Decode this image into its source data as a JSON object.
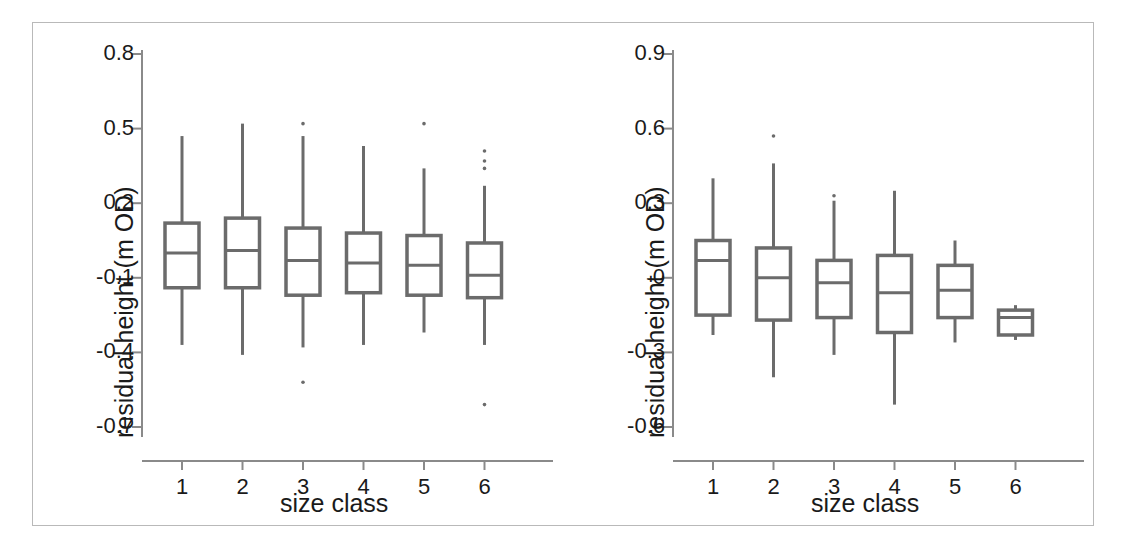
{
  "figure": {
    "background": "#ffffff",
    "frame_color": "#b9b9b9",
    "ink_color": "#6b6b6b",
    "text_color": "#1a1a1a"
  },
  "chart_data": [
    {
      "type": "box",
      "panel": "left",
      "title": "",
      "xlabel": "size class",
      "ylabel": "residual height (m OD)",
      "categories": [
        "1",
        "2",
        "3",
        "4",
        "5",
        "6"
      ],
      "xtick_labels": [
        "1",
        "2",
        "3",
        "4",
        "5",
        "6"
      ],
      "ytick_labels": [
        "0.8",
        "0.5",
        "0.2",
        "-0.1",
        "-0.4",
        "-0.7"
      ],
      "yticks": [
        0.8,
        0.5,
        0.2,
        -0.1,
        -0.4,
        -0.7
      ],
      "ylim": [
        -0.78,
        0.88
      ],
      "grid": false,
      "legend": "none",
      "boxes": [
        {
          "category": "1",
          "whisker_low": -0.37,
          "q1": -0.14,
          "median": 0.0,
          "q3": 0.12,
          "whisker_high": 0.47,
          "outliers": []
        },
        {
          "category": "2",
          "whisker_low": -0.41,
          "q1": -0.14,
          "median": 0.01,
          "q3": 0.14,
          "whisker_high": 0.52,
          "outliers": []
        },
        {
          "category": "3",
          "whisker_low": -0.38,
          "q1": -0.17,
          "median": -0.03,
          "q3": 0.1,
          "whisker_high": 0.47,
          "outliers": [
            0.52,
            -0.52
          ]
        },
        {
          "category": "4",
          "whisker_low": -0.37,
          "q1": -0.16,
          "median": -0.04,
          "q3": 0.08,
          "whisker_high": 0.43,
          "outliers": []
        },
        {
          "category": "5",
          "whisker_low": -0.32,
          "q1": -0.17,
          "median": -0.05,
          "q3": 0.07,
          "whisker_high": 0.34,
          "outliers": [
            0.52
          ]
        },
        {
          "category": "6",
          "whisker_low": -0.37,
          "q1": -0.18,
          "median": -0.09,
          "q3": 0.04,
          "whisker_high": 0.27,
          "outliers": [
            0.41,
            0.37,
            0.34,
            -0.61
          ]
        }
      ]
    },
    {
      "type": "box",
      "panel": "right",
      "title": "",
      "xlabel": "size class",
      "ylabel": "residual height (m OD)",
      "categories": [
        "1",
        "2",
        "3",
        "4",
        "5",
        "6"
      ],
      "xtick_labels": [
        "1",
        "2",
        "3",
        "4",
        "5",
        "6"
      ],
      "ytick_labels": [
        "0.9",
        "0.6",
        "0.3",
        "0",
        "-0.3",
        "-0.6"
      ],
      "yticks": [
        0.9,
        0.6,
        0.3,
        0.0,
        -0.3,
        -0.6
      ],
      "ylim": [
        -0.68,
        0.98
      ],
      "grid": false,
      "legend": "none",
      "boxes": [
        {
          "category": "1",
          "whisker_low": -0.23,
          "q1": -0.15,
          "median": 0.07,
          "q3": 0.15,
          "whisker_high": 0.4,
          "outliers": []
        },
        {
          "category": "2",
          "whisker_low": -0.4,
          "q1": -0.17,
          "median": 0.0,
          "q3": 0.12,
          "whisker_high": 0.46,
          "outliers": [
            0.57
          ]
        },
        {
          "category": "3",
          "whisker_low": -0.31,
          "q1": -0.16,
          "median": -0.02,
          "q3": 0.07,
          "whisker_high": 0.31,
          "outliers": [
            0.33
          ]
        },
        {
          "category": "4",
          "whisker_low": -0.51,
          "q1": -0.22,
          "median": -0.06,
          "q3": 0.09,
          "whisker_high": 0.35,
          "outliers": []
        },
        {
          "category": "5",
          "whisker_low": -0.26,
          "q1": -0.16,
          "median": -0.05,
          "q3": 0.05,
          "whisker_high": 0.15,
          "outliers": []
        },
        {
          "category": "6",
          "whisker_low": -0.25,
          "q1": -0.23,
          "median": -0.16,
          "q3": -0.13,
          "whisker_high": -0.11,
          "outliers": []
        }
      ]
    }
  ]
}
